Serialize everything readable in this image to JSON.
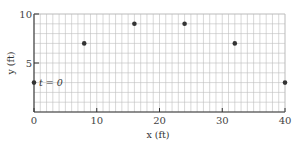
{
  "chart_data": {
    "type": "scatter",
    "title": "",
    "xlabel": "x (ft)",
    "ylabel": "y (ft)",
    "xlim": [
      0,
      40
    ],
    "ylim": [
      0,
      10
    ],
    "grid": true,
    "grid_step": {
      "x": 1,
      "y": 1
    },
    "x_ticks": [
      0,
      10,
      20,
      30,
      40
    ],
    "y_ticks": [
      5,
      10
    ],
    "series": [
      {
        "name": "position",
        "x": [
          0,
          8,
          16,
          24,
          32,
          40
        ],
        "y": [
          3,
          7,
          9,
          9,
          7,
          3
        ]
      }
    ],
    "annotations": [
      {
        "text": "t = 0",
        "x": 0,
        "y": 3
      }
    ],
    "colors": {
      "point": "#333333",
      "grid": "#bdbdbd",
      "axis": "#333333"
    }
  }
}
